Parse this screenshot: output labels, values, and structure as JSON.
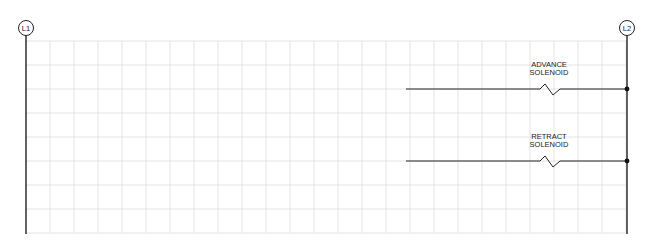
{
  "diagram": {
    "type": "ladder-diagram",
    "rails": [
      {
        "id": "L1",
        "label": "L1"
      },
      {
        "id": "L2",
        "label": "L2"
      }
    ],
    "rungs": [
      {
        "label_line1": "ADVANCE",
        "label_line2": "SOLENOID",
        "component": "solenoid-coil"
      },
      {
        "label_line1": "RETRACT",
        "label_line2": "SOLENOID",
        "component": "solenoid-coil"
      }
    ],
    "colors": {
      "line": "#222222",
      "grid": "#dcdcdc",
      "background": "#ffffff"
    }
  }
}
